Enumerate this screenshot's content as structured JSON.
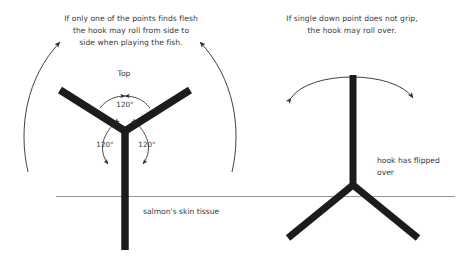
{
  "figure": {
    "title_caption_left": "If only one of the points finds flesh the hook may roll from side to side when playing the fish.",
    "background_color": "#ffffff",
    "ink_color": "#1c1c1c",
    "text_color": "#3a3a3a",
    "skin_line_color": "#8a8a8a"
  },
  "left_panel": {
    "caption_lines": [
      "If only one of the points finds flesh",
      "the hook may roll from side to",
      "side when playing the fish."
    ],
    "top_label": "Top",
    "angles": {
      "upper": "120°",
      "lower_left": "120°",
      "lower_right": "120°"
    },
    "surface_label": "salmon's skin tissue"
  },
  "right_panel": {
    "caption_lines": [
      "If single down point does not grip,",
      "the hook may roll over."
    ],
    "state_label_lines": [
      "hook has flipped",
      "over"
    ]
  },
  "icons": {
    "roll_arrow_left": "curved-arrow-left-icon",
    "roll_arrow_right": "curved-arrow-right-icon",
    "angle_arc_upper": "angle-arc-icon",
    "angle_arc_lower_left": "angle-arc-icon",
    "angle_arc_lower_right": "angle-arc-icon",
    "roll_over_arc": "double-headed-arc-arrow-icon"
  }
}
